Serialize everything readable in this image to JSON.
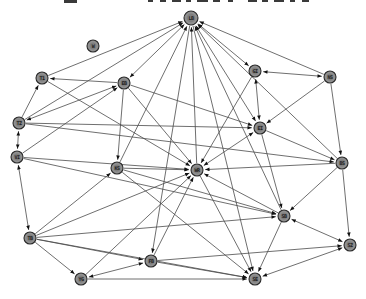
{
  "graph": {
    "background": "#ffffff",
    "node_fill": "#909090",
    "node_fill_inner": "#6f6f6f",
    "node_stroke": "#2a2a2a",
    "edge_color": "#4a4a4a",
    "arrow_color": "#111111",
    "label_color": "#1c1c1c",
    "fragment_color": "#3a3a3a",
    "top_fragments": [
      {
        "x": 64,
        "w": 13,
        "h": 3
      },
      {
        "x": 148,
        "w": 5,
        "h": 2
      },
      {
        "x": 160,
        "w": 6,
        "h": 2
      },
      {
        "x": 172,
        "w": 9,
        "h": 2
      },
      {
        "x": 186,
        "w": 5,
        "h": 2
      },
      {
        "x": 197,
        "w": 11,
        "h": 2
      },
      {
        "x": 213,
        "w": 7,
        "h": 2
      },
      {
        "x": 228,
        "w": 5,
        "h": 2
      },
      {
        "x": 248,
        "w": 9,
        "h": 2
      },
      {
        "x": 262,
        "w": 6,
        "h": 2
      },
      {
        "x": 274,
        "w": 10,
        "h": 2
      },
      {
        "x": 290,
        "w": 5,
        "h": 2
      },
      {
        "x": 302,
        "w": 7,
        "h": 2
      }
    ],
    "nodes": [
      {
        "id": "n1",
        "label": "LB",
        "x": 191,
        "y": 18,
        "r": 7
      },
      {
        "id": "n2",
        "label": "W",
        "x": 93,
        "y": 46,
        "r": 6
      },
      {
        "id": "n3",
        "label": "T1",
        "x": 42,
        "y": 78,
        "r": 6
      },
      {
        "id": "n4",
        "label": "EB",
        "x": 124,
        "y": 83,
        "r": 6
      },
      {
        "id": "n5",
        "label": "GI",
        "x": 255,
        "y": 71,
        "r": 6
      },
      {
        "id": "n6",
        "label": "NS",
        "x": 330,
        "y": 77,
        "r": 6
      },
      {
        "id": "n7",
        "label": "TZ",
        "x": 19,
        "y": 123,
        "r": 6
      },
      {
        "id": "n8",
        "label": "VI",
        "x": 17,
        "y": 157,
        "r": 6
      },
      {
        "id": "n9",
        "label": "KS",
        "x": 117,
        "y": 168,
        "r": 6
      },
      {
        "id": "n10",
        "label": "EI",
        "x": 260,
        "y": 128,
        "r": 6
      },
      {
        "id": "n11",
        "label": "WR",
        "x": 197,
        "y": 170,
        "r": 6
      },
      {
        "id": "n12",
        "label": "BS",
        "x": 342,
        "y": 163,
        "r": 6
      },
      {
        "id": "n13",
        "label": "TB",
        "x": 30,
        "y": 238,
        "r": 6
      },
      {
        "id": "n14",
        "label": "YG",
        "x": 81,
        "y": 279,
        "r": 6
      },
      {
        "id": "n15",
        "label": "FB",
        "x": 151,
        "y": 261,
        "r": 6
      },
      {
        "id": "n16",
        "label": "SB",
        "x": 284,
        "y": 216,
        "r": 6
      },
      {
        "id": "n17",
        "label": "SZ",
        "x": 350,
        "y": 245,
        "r": 6
      },
      {
        "id": "n18",
        "label": "SE",
        "x": 255,
        "y": 279,
        "r": 6
      }
    ],
    "edges": [
      {
        "s": "n4",
        "t": "n1",
        "dir": "both"
      },
      {
        "s": "n5",
        "t": "n1",
        "dir": "both"
      },
      {
        "s": "n10",
        "t": "n1",
        "dir": "both"
      },
      {
        "s": "n6",
        "t": "n1",
        "dir": "one"
      },
      {
        "s": "n11",
        "t": "n1",
        "dir": "one"
      },
      {
        "s": "n9",
        "t": "n1",
        "dir": "one"
      },
      {
        "s": "n12",
        "t": "n1",
        "dir": "one"
      },
      {
        "s": "n7",
        "t": "n1",
        "dir": "one"
      },
      {
        "s": "n16",
        "t": "n1",
        "dir": "one"
      },
      {
        "s": "n3",
        "t": "n1",
        "dir": "one"
      },
      {
        "s": "n1",
        "t": "n18",
        "dir": "one"
      },
      {
        "s": "n1",
        "t": "n15",
        "dir": "one"
      },
      {
        "s": "n4",
        "t": "n3",
        "dir": "one"
      },
      {
        "s": "n7",
        "t": "n3",
        "dir": "one"
      },
      {
        "s": "n7",
        "t": "n8",
        "dir": "both"
      },
      {
        "s": "n7",
        "t": "n4",
        "dir": "both"
      },
      {
        "s": "n8",
        "t": "n4",
        "dir": "one"
      },
      {
        "s": "n7",
        "t": "n10",
        "dir": "one"
      },
      {
        "s": "n8",
        "t": "n13",
        "dir": "both"
      },
      {
        "s": "n4",
        "t": "n9",
        "dir": "one"
      },
      {
        "s": "n9",
        "t": "n11",
        "dir": "one"
      },
      {
        "s": "n13",
        "t": "n11",
        "dir": "one"
      },
      {
        "s": "n13",
        "t": "n15",
        "dir": "one"
      },
      {
        "s": "n13",
        "t": "n18",
        "dir": "one"
      },
      {
        "s": "n13",
        "t": "n16",
        "dir": "one"
      },
      {
        "s": "n13",
        "t": "n9",
        "dir": "one"
      },
      {
        "s": "n13",
        "t": "n14",
        "dir": "one"
      },
      {
        "s": "n14",
        "t": "n15",
        "dir": "both"
      },
      {
        "s": "n14",
        "t": "n11",
        "dir": "one"
      },
      {
        "s": "n14",
        "t": "n18",
        "dir": "one"
      },
      {
        "s": "n15",
        "t": "n11",
        "dir": "one"
      },
      {
        "s": "n15",
        "t": "n18",
        "dir": "one"
      },
      {
        "s": "n15",
        "t": "n17",
        "dir": "one"
      },
      {
        "s": "n10",
        "t": "n11",
        "dir": "both"
      },
      {
        "s": "n10",
        "t": "n5",
        "dir": "both"
      },
      {
        "s": "n10",
        "t": "n16",
        "dir": "one"
      },
      {
        "s": "n10",
        "t": "n12",
        "dir": "one"
      },
      {
        "s": "n4",
        "t": "n10",
        "dir": "one"
      },
      {
        "s": "n5",
        "t": "n6",
        "dir": "both"
      },
      {
        "s": "n5",
        "t": "n11",
        "dir": "one"
      },
      {
        "s": "n6",
        "t": "n12",
        "dir": "one"
      },
      {
        "s": "n6",
        "t": "n10",
        "dir": "one"
      },
      {
        "s": "n12",
        "t": "n16",
        "dir": "one"
      },
      {
        "s": "n12",
        "t": "n11",
        "dir": "one"
      },
      {
        "s": "n12",
        "t": "n17",
        "dir": "one"
      },
      {
        "s": "n16",
        "t": "n11",
        "dir": "one"
      },
      {
        "s": "n16",
        "t": "n18",
        "dir": "one"
      },
      {
        "s": "n16",
        "t": "n17",
        "dir": "both"
      },
      {
        "s": "n17",
        "t": "n18",
        "dir": "both"
      },
      {
        "s": "n11",
        "t": "n18",
        "dir": "one"
      },
      {
        "s": "n7",
        "t": "n12",
        "dir": "one"
      },
      {
        "s": "n8",
        "t": "n16",
        "dir": "one"
      },
      {
        "s": "n8",
        "t": "n11",
        "dir": "one"
      },
      {
        "s": "n9",
        "t": "n16",
        "dir": "one"
      },
      {
        "s": "n9",
        "t": "n18",
        "dir": "one"
      },
      {
        "s": "n4",
        "t": "n11",
        "dir": "one"
      },
      {
        "s": "n3",
        "t": "n11",
        "dir": "one"
      }
    ]
  }
}
